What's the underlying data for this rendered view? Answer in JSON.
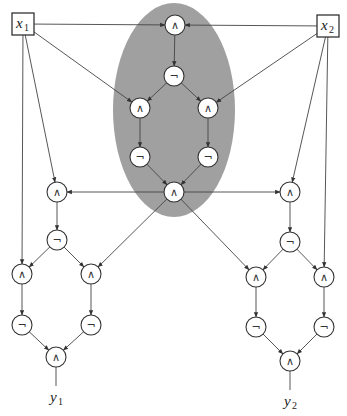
{
  "diagram": {
    "type": "boolean-circuit",
    "highlight_region": {
      "shape": "ellipse",
      "cx": 174,
      "cy": 110,
      "rx": 61,
      "ry": 107,
      "color": "#a0a0a0"
    },
    "inputs": [
      {
        "id": "x1",
        "label": "x",
        "sub": "1",
        "x": 12,
        "y": 13,
        "w": 22,
        "h": 22
      },
      {
        "id": "x2",
        "label": "x",
        "sub": "2",
        "x": 317,
        "y": 15,
        "w": 22,
        "h": 22
      }
    ],
    "outputs": [
      {
        "id": "y1",
        "label": "y",
        "sub": "1",
        "x": 56,
        "y": 400
      },
      {
        "id": "y2",
        "label": "y",
        "sub": "2",
        "x": 290,
        "y": 404
      }
    ],
    "gate_radius": 10,
    "gates": [
      {
        "id": "g1",
        "op": "∧",
        "x": 175,
        "y": 25
      },
      {
        "id": "g2",
        "op": "¬",
        "x": 174,
        "y": 76
      },
      {
        "id": "g3",
        "op": "∧",
        "x": 140,
        "y": 108
      },
      {
        "id": "g4",
        "op": "∧",
        "x": 208,
        "y": 108
      },
      {
        "id": "g5",
        "op": "¬",
        "x": 140,
        "y": 157
      },
      {
        "id": "g6",
        "op": "¬",
        "x": 208,
        "y": 157
      },
      {
        "id": "g7",
        "op": "∧",
        "x": 174,
        "y": 192
      },
      {
        "id": "l1",
        "op": "∧",
        "x": 57,
        "y": 192
      },
      {
        "id": "l2",
        "op": "¬",
        "x": 57,
        "y": 240
      },
      {
        "id": "l3",
        "op": "∧",
        "x": 22,
        "y": 274
      },
      {
        "id": "l4",
        "op": "∧",
        "x": 91,
        "y": 274
      },
      {
        "id": "l5",
        "op": "¬",
        "x": 22,
        "y": 325
      },
      {
        "id": "l6",
        "op": "¬",
        "x": 91,
        "y": 325
      },
      {
        "id": "l7",
        "op": "∧",
        "x": 56,
        "y": 357
      },
      {
        "id": "r1",
        "op": "∧",
        "x": 290,
        "y": 192
      },
      {
        "id": "r2",
        "op": "¬",
        "x": 290,
        "y": 242
      },
      {
        "id": "r3",
        "op": "∧",
        "x": 256,
        "y": 277
      },
      {
        "id": "r4",
        "op": "∧",
        "x": 324,
        "y": 277
      },
      {
        "id": "r5",
        "op": "¬",
        "x": 256,
        "y": 327
      },
      {
        "id": "r6",
        "op": "¬",
        "x": 324,
        "y": 327
      },
      {
        "id": "r7",
        "op": "∧",
        "x": 290,
        "y": 361
      }
    ],
    "edges": [
      [
        "x1",
        "g1"
      ],
      [
        "x2",
        "g1"
      ],
      [
        "g1",
        "g2"
      ],
      [
        "x1",
        "g3"
      ],
      [
        "g2",
        "g3"
      ],
      [
        "g2",
        "g4"
      ],
      [
        "x2",
        "g4"
      ],
      [
        "g3",
        "g5"
      ],
      [
        "g4",
        "g6"
      ],
      [
        "g5",
        "g7"
      ],
      [
        "g6",
        "g7"
      ],
      [
        "x1",
        "l1"
      ],
      [
        "g7",
        "l1"
      ],
      [
        "l1",
        "l2"
      ],
      [
        "x1",
        "l3"
      ],
      [
        "l2",
        "l3"
      ],
      [
        "l2",
        "l4"
      ],
      [
        "g7",
        "l4"
      ],
      [
        "l3",
        "l5"
      ],
      [
        "l4",
        "l6"
      ],
      [
        "l5",
        "l7"
      ],
      [
        "l6",
        "l7"
      ],
      [
        "x2",
        "r1"
      ],
      [
        "g7",
        "r1"
      ],
      [
        "r1",
        "r2"
      ],
      [
        "g7",
        "r3"
      ],
      [
        "r2",
        "r3"
      ],
      [
        "r2",
        "r4"
      ],
      [
        "x2",
        "r4"
      ],
      [
        "r3",
        "r5"
      ],
      [
        "r4",
        "r6"
      ],
      [
        "r5",
        "r7"
      ],
      [
        "r6",
        "r7"
      ]
    ],
    "output_lines": [
      [
        "l7",
        "y1"
      ],
      [
        "r7",
        "y2"
      ]
    ]
  }
}
